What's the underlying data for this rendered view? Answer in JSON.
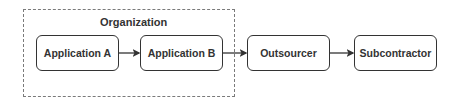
{
  "group": {
    "label": "Organization"
  },
  "nodes": [
    {
      "id": "app-a",
      "label": "Application A"
    },
    {
      "id": "app-b",
      "label": "Application B"
    },
    {
      "id": "outsourcer",
      "label": "Outsourcer"
    },
    {
      "id": "subcontractor",
      "label": "Subcontractor"
    }
  ],
  "edges": [
    {
      "from": "app-a",
      "to": "app-b"
    },
    {
      "from": "app-b",
      "to": "outsourcer"
    },
    {
      "from": "outsourcer",
      "to": "subcontractor"
    }
  ],
  "colors": {
    "stroke": "#333333",
    "group_border": "#7a7a7a",
    "background": "#ffffff"
  }
}
